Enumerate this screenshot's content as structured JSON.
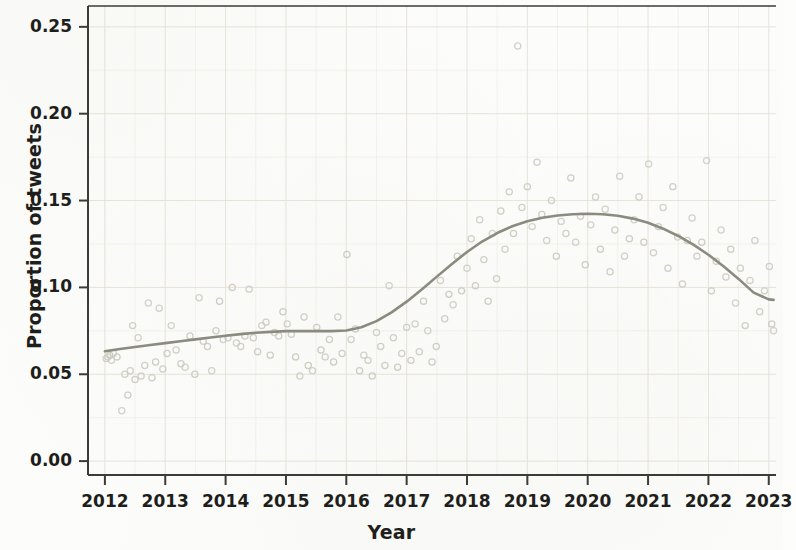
{
  "chart_data": {
    "type": "scatter",
    "title": "",
    "xlabel": "Year",
    "ylabel": "Proportion of tweets",
    "xlim": [
      2011.72,
      2023.12
    ],
    "ylim": [
      -0.008,
      0.262
    ],
    "grid": true,
    "legend": null,
    "x_tick_labels": [
      "2012",
      "2013",
      "2014",
      "2015",
      "2016",
      "2017",
      "2018",
      "2019",
      "2020",
      "2021",
      "2022",
      "2023"
    ],
    "x_ticks": [
      2012,
      2013,
      2014,
      2015,
      2016,
      2017,
      2018,
      2019,
      2020,
      2021,
      2022,
      2023
    ],
    "y_tick_labels": [
      "0.00",
      "0.05",
      "0.10",
      "0.15",
      "0.20",
      "0.25"
    ],
    "y_ticks": [
      0.0,
      0.05,
      0.1,
      0.15,
      0.2,
      0.25
    ],
    "minor_y_ticks": [
      0.025,
      0.075,
      0.125,
      0.175,
      0.225
    ],
    "marker": "open-circle",
    "marker_color": "#cdcdc4",
    "trend_color": "#8b8b80",
    "grid_color": "#e7e4da",
    "axis_color": "#3a3a36",
    "background_color": "#fdfdfb",
    "series": [
      {
        "name": "Monthly proportion of tweets",
        "type": "scatter",
        "points": [
          [
            2012.02,
            0.059
          ],
          [
            2012.05,
            0.06
          ],
          [
            2012.08,
            0.061
          ],
          [
            2012.11,
            0.058
          ],
          [
            2012.14,
            0.062
          ],
          [
            2012.2,
            0.06
          ],
          [
            2012.28,
            0.029
          ],
          [
            2012.33,
            0.05
          ],
          [
            2012.38,
            0.038
          ],
          [
            2012.42,
            0.052
          ],
          [
            2012.46,
            0.078
          ],
          [
            2012.5,
            0.047
          ],
          [
            2012.55,
            0.071
          ],
          [
            2012.6,
            0.049
          ],
          [
            2012.66,
            0.055
          ],
          [
            2012.72,
            0.091
          ],
          [
            2012.78,
            0.048
          ],
          [
            2012.84,
            0.057
          ],
          [
            2012.9,
            0.088
          ],
          [
            2012.96,
            0.053
          ],
          [
            2013.03,
            0.062
          ],
          [
            2013.1,
            0.078
          ],
          [
            2013.18,
            0.064
          ],
          [
            2013.26,
            0.056
          ],
          [
            2013.33,
            0.054
          ],
          [
            2013.41,
            0.072
          ],
          [
            2013.49,
            0.05
          ],
          [
            2013.56,
            0.094
          ],
          [
            2013.63,
            0.069
          ],
          [
            2013.7,
            0.066
          ],
          [
            2013.77,
            0.052
          ],
          [
            2013.84,
            0.075
          ],
          [
            2013.9,
            0.092
          ],
          [
            2013.96,
            0.07
          ],
          [
            2014.04,
            0.071
          ],
          [
            2014.11,
            0.1
          ],
          [
            2014.18,
            0.068
          ],
          [
            2014.25,
            0.066
          ],
          [
            2014.32,
            0.072
          ],
          [
            2014.39,
            0.099
          ],
          [
            2014.46,
            0.071
          ],
          [
            2014.53,
            0.063
          ],
          [
            2014.6,
            0.078
          ],
          [
            2014.67,
            0.08
          ],
          [
            2014.74,
            0.061
          ],
          [
            2014.81,
            0.074
          ],
          [
            2014.88,
            0.072
          ],
          [
            2014.95,
            0.086
          ],
          [
            2015.02,
            0.079
          ],
          [
            2015.09,
            0.073
          ],
          [
            2015.16,
            0.06
          ],
          [
            2015.23,
            0.049
          ],
          [
            2015.3,
            0.083
          ],
          [
            2015.37,
            0.055
          ],
          [
            2015.44,
            0.052
          ],
          [
            2015.51,
            0.077
          ],
          [
            2015.58,
            0.064
          ],
          [
            2015.65,
            0.06
          ],
          [
            2015.72,
            0.07
          ],
          [
            2015.79,
            0.057
          ],
          [
            2015.86,
            0.083
          ],
          [
            2015.93,
            0.062
          ],
          [
            2016.01,
            0.119
          ],
          [
            2016.08,
            0.07
          ],
          [
            2016.15,
            0.076
          ],
          [
            2016.22,
            0.052
          ],
          [
            2016.29,
            0.061
          ],
          [
            2016.36,
            0.058
          ],
          [
            2016.43,
            0.049
          ],
          [
            2016.5,
            0.074
          ],
          [
            2016.57,
            0.066
          ],
          [
            2016.64,
            0.055
          ],
          [
            2016.71,
            0.101
          ],
          [
            2016.78,
            0.071
          ],
          [
            2016.85,
            0.054
          ],
          [
            2016.92,
            0.062
          ],
          [
            2017.0,
            0.077
          ],
          [
            2017.07,
            0.058
          ],
          [
            2017.14,
            0.079
          ],
          [
            2017.21,
            0.063
          ],
          [
            2017.28,
            0.092
          ],
          [
            2017.35,
            0.075
          ],
          [
            2017.42,
            0.057
          ],
          [
            2017.49,
            0.066
          ],
          [
            2017.56,
            0.104
          ],
          [
            2017.63,
            0.082
          ],
          [
            2017.7,
            0.096
          ],
          [
            2017.77,
            0.09
          ],
          [
            2017.84,
            0.118
          ],
          [
            2017.91,
            0.098
          ],
          [
            2018.0,
            0.111
          ],
          [
            2018.07,
            0.128
          ],
          [
            2018.14,
            0.101
          ],
          [
            2018.21,
            0.139
          ],
          [
            2018.28,
            0.116
          ],
          [
            2018.35,
            0.092
          ],
          [
            2018.42,
            0.131
          ],
          [
            2018.49,
            0.105
          ],
          [
            2018.56,
            0.144
          ],
          [
            2018.63,
            0.122
          ],
          [
            2018.7,
            0.155
          ],
          [
            2018.77,
            0.131
          ],
          [
            2018.84,
            0.239
          ],
          [
            2018.91,
            0.146
          ],
          [
            2019.0,
            0.158
          ],
          [
            2019.08,
            0.135
          ],
          [
            2019.16,
            0.172
          ],
          [
            2019.24,
            0.142
          ],
          [
            2019.32,
            0.127
          ],
          [
            2019.4,
            0.15
          ],
          [
            2019.48,
            0.118
          ],
          [
            2019.56,
            0.138
          ],
          [
            2019.64,
            0.131
          ],
          [
            2019.72,
            0.163
          ],
          [
            2019.8,
            0.126
          ],
          [
            2019.88,
            0.141
          ],
          [
            2019.96,
            0.113
          ],
          [
            2020.05,
            0.136
          ],
          [
            2020.13,
            0.152
          ],
          [
            2020.21,
            0.122
          ],
          [
            2020.29,
            0.145
          ],
          [
            2020.37,
            0.109
          ],
          [
            2020.45,
            0.133
          ],
          [
            2020.53,
            0.164
          ],
          [
            2020.61,
            0.118
          ],
          [
            2020.69,
            0.128
          ],
          [
            2020.77,
            0.139
          ],
          [
            2020.85,
            0.152
          ],
          [
            2020.93,
            0.126
          ],
          [
            2021.01,
            0.171
          ],
          [
            2021.09,
            0.12
          ],
          [
            2021.17,
            0.135
          ],
          [
            2021.25,
            0.146
          ],
          [
            2021.33,
            0.111
          ],
          [
            2021.41,
            0.158
          ],
          [
            2021.49,
            0.129
          ],
          [
            2021.57,
            0.102
          ],
          [
            2021.65,
            0.127
          ],
          [
            2021.73,
            0.14
          ],
          [
            2021.81,
            0.118
          ],
          [
            2021.89,
            0.126
          ],
          [
            2021.97,
            0.173
          ],
          [
            2022.05,
            0.098
          ],
          [
            2022.13,
            0.115
          ],
          [
            2022.21,
            0.133
          ],
          [
            2022.29,
            0.106
          ],
          [
            2022.37,
            0.122
          ],
          [
            2022.45,
            0.091
          ],
          [
            2022.53,
            0.111
          ],
          [
            2022.61,
            0.078
          ],
          [
            2022.69,
            0.104
          ],
          [
            2022.77,
            0.127
          ],
          [
            2022.85,
            0.086
          ],
          [
            2022.93,
            0.098
          ],
          [
            2023.01,
            0.112
          ],
          [
            2023.05,
            0.079
          ],
          [
            2023.08,
            0.075
          ]
        ]
      },
      {
        "name": "Smoothed trend",
        "type": "line",
        "points": [
          [
            2012.0,
            0.0632
          ],
          [
            2012.25,
            0.0645
          ],
          [
            2012.5,
            0.0657
          ],
          [
            2012.75,
            0.0668
          ],
          [
            2013.0,
            0.0679
          ],
          [
            2013.25,
            0.069
          ],
          [
            2013.5,
            0.0701
          ],
          [
            2013.75,
            0.0712
          ],
          [
            2014.0,
            0.0722
          ],
          [
            2014.25,
            0.0731
          ],
          [
            2014.5,
            0.0739
          ],
          [
            2014.75,
            0.0744
          ],
          [
            2015.0,
            0.0748
          ],
          [
            2015.25,
            0.0749
          ],
          [
            2015.5,
            0.0748
          ],
          [
            2015.75,
            0.0748
          ],
          [
            2016.0,
            0.0752
          ],
          [
            2016.25,
            0.0771
          ],
          [
            2016.5,
            0.0806
          ],
          [
            2016.75,
            0.0856
          ],
          [
            2017.0,
            0.0918
          ],
          [
            2017.25,
            0.0988
          ],
          [
            2017.5,
            0.1062
          ],
          [
            2017.75,
            0.1135
          ],
          [
            2018.0,
            0.1204
          ],
          [
            2018.25,
            0.1264
          ],
          [
            2018.5,
            0.1313
          ],
          [
            2018.75,
            0.1352
          ],
          [
            2019.0,
            0.1381
          ],
          [
            2019.25,
            0.1401
          ],
          [
            2019.5,
            0.1414
          ],
          [
            2019.75,
            0.1421
          ],
          [
            2020.0,
            0.1424
          ],
          [
            2020.25,
            0.1421
          ],
          [
            2020.5,
            0.1412
          ],
          [
            2020.75,
            0.1396
          ],
          [
            2021.0,
            0.1372
          ],
          [
            2021.25,
            0.1338
          ],
          [
            2021.5,
            0.1296
          ],
          [
            2021.75,
            0.1246
          ],
          [
            2022.0,
            0.1188
          ],
          [
            2022.25,
            0.1122
          ],
          [
            2022.5,
            0.1049
          ],
          [
            2022.75,
            0.097
          ],
          [
            2023.0,
            0.0931
          ],
          [
            2023.08,
            0.0928
          ]
        ]
      }
    ]
  }
}
